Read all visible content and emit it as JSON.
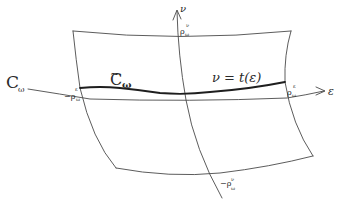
{
  "diagram": {
    "type": "hand-drawn surface patch with coordinate axes",
    "colors": {
      "ink": "#3a3a3a",
      "thick_ink": "#1e1e1e",
      "background": "#ffffff"
    },
    "labels": {
      "curve_left": "C",
      "curve_left_sub": "ω",
      "curve_tilde": "C",
      "curve_tilde_sub": "ω",
      "graph_eq": "ν = t(ε)",
      "axis_horizontal": "ε",
      "axis_vertical": "ν",
      "rho_left": "−ρ",
      "rho_left_sup": "ε",
      "rho_left_sub": "ω",
      "rho_right": "ρ",
      "rho_right_sup": "ε",
      "rho_right_sub": "ω",
      "rho_top": "ρ",
      "rho_top_sup": "ν",
      "rho_top_sub": "ω",
      "rho_bottom": "−ρ",
      "rho_bottom_sup": "ν",
      "rho_bottom_sub": "ω"
    },
    "elements": [
      "curved quadrilateral surface patch",
      "horizontal curve C_ω with arrow in ε direction",
      "vertical curve with arrow in ν direction",
      "thick curve C̃_ω given by ν = t(ε)"
    ]
  }
}
